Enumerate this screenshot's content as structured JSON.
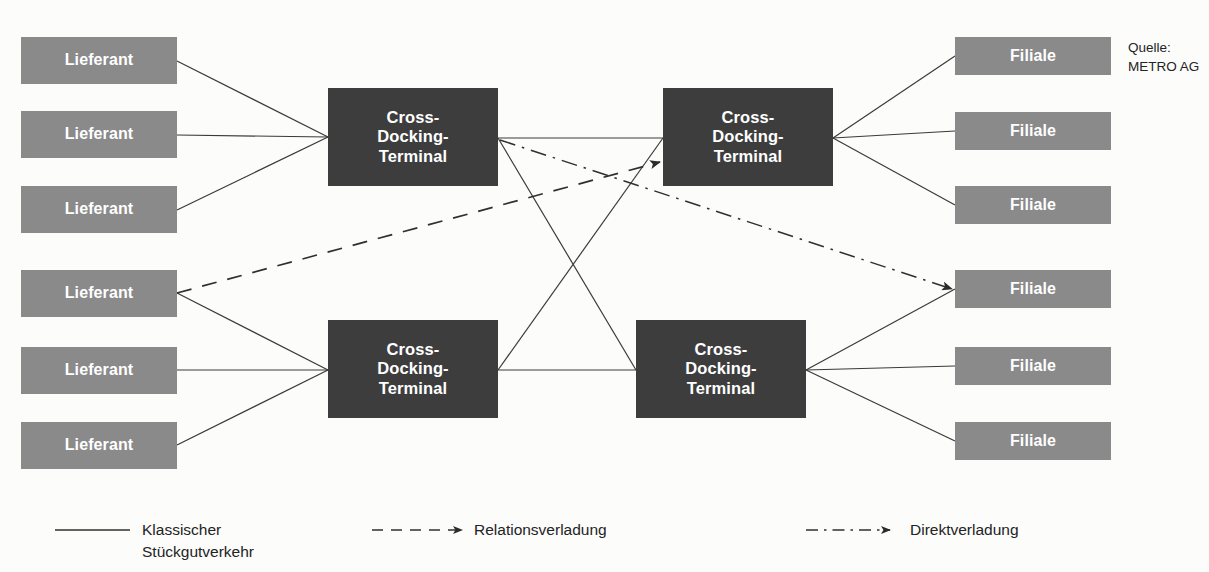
{
  "figure": {
    "background_color": "#fcfcfb",
    "supplier_color": "#8a8a8a",
    "terminal_color": "#3d3d3d",
    "line_color": "#3a3a3a",
    "text_color": "#232323"
  },
  "source_note": "Quelle:\nMETRO AG",
  "nodes": {
    "suppliers": [
      {
        "label": "Lieferant",
        "x": 21,
        "y": 37,
        "w": 156,
        "h": 47
      },
      {
        "label": "Lieferant",
        "x": 21,
        "y": 111,
        "w": 156,
        "h": 47
      },
      {
        "label": "Lieferant",
        "x": 21,
        "y": 186,
        "w": 156,
        "h": 47
      },
      {
        "label": "Lieferant",
        "x": 21,
        "y": 270,
        "w": 156,
        "h": 47
      },
      {
        "label": "Lieferant",
        "x": 21,
        "y": 347,
        "w": 156,
        "h": 47
      },
      {
        "label": "Lieferant",
        "x": 21,
        "y": 422,
        "w": 156,
        "h": 47
      }
    ],
    "terminals": [
      {
        "label": "Cross-\nDocking-\nTerminal",
        "x": 328,
        "y": 88,
        "w": 170,
        "h": 98
      },
      {
        "label": "Cross-\nDocking-\nTerminal",
        "x": 663,
        "y": 88,
        "w": 170,
        "h": 98
      },
      {
        "label": "Cross-\nDocking-\nTerminal",
        "x": 328,
        "y": 320,
        "w": 170,
        "h": 98
      },
      {
        "label": "Cross-\nDocking-\nTerminal",
        "x": 636,
        "y": 320,
        "w": 170,
        "h": 98
      }
    ],
    "stores": [
      {
        "label": "Filiale",
        "x": 955,
        "y": 37,
        "w": 156,
        "h": 38
      },
      {
        "label": "Filiale",
        "x": 955,
        "y": 112,
        "w": 156,
        "h": 38
      },
      {
        "label": "Filiale",
        "x": 955,
        "y": 186,
        "w": 156,
        "h": 38
      },
      {
        "label": "Filiale",
        "x": 955,
        "y": 270,
        "w": 156,
        "h": 38
      },
      {
        "label": "Filiale",
        "x": 955,
        "y": 347,
        "w": 156,
        "h": 38
      },
      {
        "label": "Filiale",
        "x": 955,
        "y": 422,
        "w": 156,
        "h": 38
      }
    ]
  },
  "edges": {
    "solid": [
      {
        "from": "supplier-1",
        "to": "terminal-1",
        "x1": 177,
        "y1": 61,
        "x2": 328,
        "y2": 137
      },
      {
        "from": "supplier-2",
        "to": "terminal-1",
        "x1": 177,
        "y1": 135,
        "x2": 328,
        "y2": 137
      },
      {
        "from": "supplier-3",
        "to": "terminal-1",
        "x1": 177,
        "y1": 210,
        "x2": 328,
        "y2": 137
      },
      {
        "from": "supplier-4",
        "to": "terminal-3",
        "x1": 177,
        "y1": 293,
        "x2": 328,
        "y2": 370
      },
      {
        "from": "supplier-5",
        "to": "terminal-3",
        "x1": 177,
        "y1": 370,
        "x2": 328,
        "y2": 370
      },
      {
        "from": "supplier-6",
        "to": "terminal-3",
        "x1": 177,
        "y1": 445,
        "x2": 328,
        "y2": 370
      },
      {
        "from": "terminal-1",
        "to": "terminal-2",
        "x1": 498,
        "y1": 138,
        "x2": 663,
        "y2": 138
      },
      {
        "from": "terminal-3",
        "to": "terminal-4",
        "x1": 498,
        "y1": 370,
        "x2": 636,
        "y2": 370
      },
      {
        "from": "terminal-1",
        "to": "terminal-4",
        "x1": 498,
        "y1": 138,
        "x2": 636,
        "y2": 370
      },
      {
        "from": "terminal-3",
        "to": "terminal-2",
        "x1": 498,
        "y1": 370,
        "x2": 663,
        "y2": 138
      },
      {
        "from": "terminal-2",
        "to": "store-1",
        "x1": 833,
        "y1": 138,
        "x2": 955,
        "y2": 56
      },
      {
        "from": "terminal-2",
        "to": "store-2",
        "x1": 833,
        "y1": 138,
        "x2": 955,
        "y2": 131
      },
      {
        "from": "terminal-2",
        "to": "store-3",
        "x1": 833,
        "y1": 138,
        "x2": 955,
        "y2": 205
      },
      {
        "from": "terminal-4",
        "to": "store-4",
        "x1": 806,
        "y1": 370,
        "x2": 955,
        "y2": 289
      },
      {
        "from": "terminal-4",
        "to": "store-5",
        "x1": 806,
        "y1": 370,
        "x2": 955,
        "y2": 366
      },
      {
        "from": "terminal-4",
        "to": "store-6",
        "x1": 806,
        "y1": 370,
        "x2": 955,
        "y2": 441
      }
    ],
    "dashed": [
      {
        "from": "supplier-4",
        "to": "terminal-2",
        "x1": 177,
        "y1": 293,
        "x2": 660,
        "y2": 162,
        "style": "dashed",
        "arrow": true
      }
    ],
    "dashdot": [
      {
        "from": "terminal-1",
        "to": "store-4",
        "x1": 500,
        "y1": 140,
        "x2": 952,
        "y2": 289,
        "style": "dash-dot",
        "arrow": true
      }
    ]
  },
  "legend": {
    "items": [
      {
        "label": "Klassischer\nStückgutverkehr",
        "style": "solid",
        "arrow": false,
        "line_x1": 55,
        "line_x2": 130,
        "line_y": 530,
        "text_x": 142,
        "text_y": 519
      },
      {
        "label": "Relationsverladung",
        "style": "dashed",
        "arrow": true,
        "line_x1": 372,
        "line_x2": 462,
        "line_y": 530,
        "text_x": 474,
        "text_y": 519
      },
      {
        "label": "Direktverladung",
        "style": "dash-dot",
        "arrow": true,
        "line_x1": 806,
        "line_x2": 890,
        "line_y": 530,
        "text_x": 910,
        "text_y": 519
      }
    ]
  }
}
